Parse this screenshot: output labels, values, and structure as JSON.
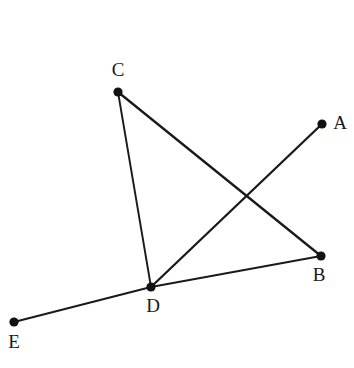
{
  "figure": {
    "background_color": "#ffffff",
    "stroke_color": "#1a1a1a",
    "dot_color": "#121212",
    "label_color": "#1a1a1a",
    "canvas": {
      "width": 354,
      "height": 368
    },
    "points": [
      {
        "id": "A",
        "label": "A",
        "x": 322,
        "y": 124,
        "radius": 4.6,
        "label_x": 340,
        "label_y": 125
      },
      {
        "id": "B",
        "label": "B",
        "x": 321,
        "y": 256,
        "radius": 4.6,
        "label_x": 319,
        "label_y": 277
      },
      {
        "id": "C",
        "label": "C",
        "x": 118,
        "y": 92,
        "radius": 4.6,
        "label_x": 118,
        "label_y": 72
      },
      {
        "id": "D",
        "label": "D",
        "x": 151,
        "y": 287,
        "radius": 4.6,
        "label_x": 153,
        "label_y": 308
      },
      {
        "id": "E",
        "label": "E",
        "x": 14,
        "y": 322,
        "radius": 4.6,
        "label_x": 14,
        "label_y": 344
      }
    ],
    "segments": [
      {
        "id": "CD",
        "from": "C",
        "to": "D",
        "width": 1.9
      },
      {
        "id": "CB",
        "from": "C",
        "to": "B",
        "width": 2.3
      },
      {
        "id": "DA",
        "from": "D",
        "to": "A",
        "width": 2.3
      },
      {
        "id": "DB",
        "from": "D",
        "to": "B",
        "width": 1.9
      },
      {
        "id": "ED",
        "from": "E",
        "to": "D",
        "width": 1.9
      }
    ],
    "intersections": [
      {
        "id": "CB-x-DA",
        "of": [
          "CB",
          "DA"
        ],
        "x": 247,
        "y": 198
      }
    ]
  }
}
